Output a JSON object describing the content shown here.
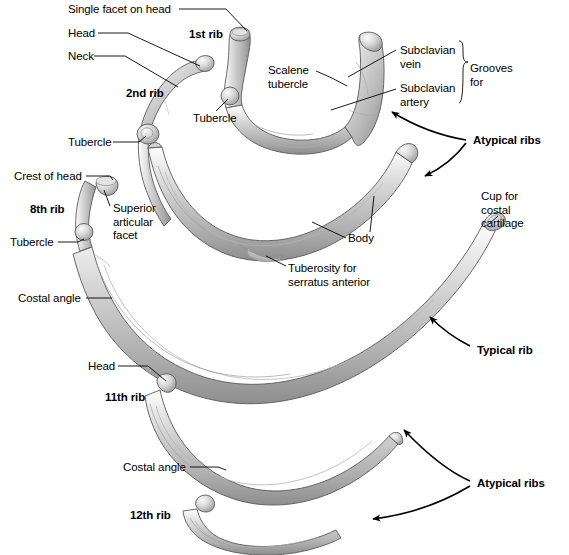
{
  "figure": {
    "background_color": "#ffffff",
    "bone_fill": "#cfcfcf",
    "bone_light": "#efefef",
    "bone_dark": "#8f8f8f",
    "outline_color": "#4a4a4a",
    "leader_color": "#000000",
    "text_color": "#000000"
  },
  "labels": {
    "single_facet_on_head": "Single facet on head",
    "head_top": "Head",
    "neck": "Neck",
    "rib_1": "1st rib",
    "rib_2": "2nd rib",
    "tubercle_2nd": "Tubercle",
    "tubercle_1st": "Tubercle",
    "scalene_tubercle": "Scalene\ntubercle",
    "subclavian_vein": "Subclavian\nvein",
    "subclavian_artery": "Subclavian\nartery",
    "grooves_for": "Grooves\nfor",
    "atypical_ribs_top": "Atypical ribs",
    "crest_of_head": "Crest of head",
    "rib_8": "8th rib",
    "superior_articular_facet": "Superior\narticular\nfacet",
    "tubercle_8th": "Tubercle",
    "costal_angle_8th": "Costal angle",
    "body": "Body",
    "tuberosity_serratus": "Tuberosity for\nserratus anterior",
    "cup_for_costal_cartilage": "Cup for\ncostal\ncartilage",
    "typical_rib": "Typical rib",
    "head_11th": "Head",
    "rib_11": "11th rib",
    "costal_angle_11th": "Costal angle",
    "rib_12": "12th rib",
    "atypical_ribs_bottom": "Atypical ribs"
  },
  "label_positions": {
    "single_facet_on_head": {
      "x": 68,
      "y": 3
    },
    "head_top": {
      "x": 68,
      "y": 27
    },
    "neck": {
      "x": 68,
      "y": 50
    },
    "rib_1": {
      "x": 189,
      "y": 28
    },
    "rib_2": {
      "x": 126,
      "y": 87
    },
    "tubercle_2nd": {
      "x": 68,
      "y": 136
    },
    "tubercle_1st": {
      "x": 193,
      "y": 112
    },
    "scalene_tubercle": {
      "x": 268,
      "y": 64
    },
    "subclavian_vein": {
      "x": 400,
      "y": 44
    },
    "subclavian_artery": {
      "x": 400,
      "y": 82
    },
    "grooves_for": {
      "x": 470,
      "y": 62
    },
    "atypical_ribs_top": {
      "x": 473,
      "y": 134
    },
    "crest_of_head": {
      "x": 14,
      "y": 170
    },
    "rib_8": {
      "x": 30,
      "y": 203
    },
    "superior_articular_facet": {
      "x": 113,
      "y": 202
    },
    "tubercle_8th": {
      "x": 10,
      "y": 236
    },
    "costal_angle_8th": {
      "x": 18,
      "y": 292
    },
    "body": {
      "x": 348,
      "y": 232
    },
    "tuberosity_serratus": {
      "x": 288,
      "y": 262
    },
    "cup_for_costal_cartilage": {
      "x": 481,
      "y": 190
    },
    "typical_rib": {
      "x": 477,
      "y": 344
    },
    "head_11th": {
      "x": 88,
      "y": 360
    },
    "rib_11": {
      "x": 105,
      "y": 391
    },
    "costal_angle_11th": {
      "x": 123,
      "y": 461
    },
    "rib_12": {
      "x": 130,
      "y": 509
    },
    "atypical_ribs_bottom": {
      "x": 477,
      "y": 477
    }
  },
  "structures": [
    {
      "name": "2nd rib",
      "region": "upper-left"
    },
    {
      "name": "1st rib",
      "region": "upper-center"
    },
    {
      "name": "8th rib",
      "region": "middle"
    },
    {
      "name": "11th rib",
      "region": "lower"
    },
    {
      "name": "12th rib",
      "region": "bottom"
    }
  ],
  "groupings": [
    {
      "label": "Atypical ribs",
      "members": [
        "1st rib",
        "2nd rib"
      ]
    },
    {
      "label": "Typical rib",
      "members": [
        "8th rib"
      ]
    },
    {
      "label": "Atypical ribs",
      "members": [
        "11th rib",
        "12th rib"
      ]
    },
    {
      "label": "Grooves for",
      "members": [
        "Subclavian vein",
        "Subclavian artery"
      ]
    }
  ]
}
